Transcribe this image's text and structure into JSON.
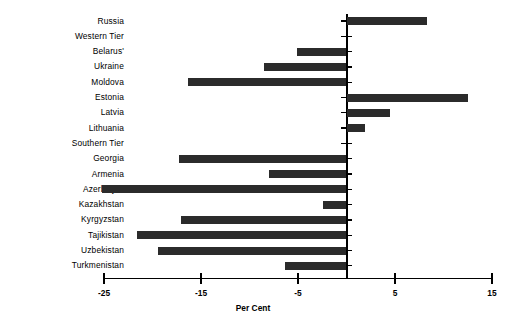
{
  "chart_data": {
    "type": "bar",
    "orientation": "horizontal",
    "title": "",
    "subtitle": "",
    "xlabel": "Per Cent",
    "ylabel": "",
    "xlim": [
      -25,
      15
    ],
    "xticks": [
      -25,
      -15,
      -5,
      5,
      15
    ],
    "xtick_labels": [
      "-25",
      "-15",
      "-5",
      "5",
      "15"
    ],
    "grid": false,
    "legend": null,
    "bar_color": "#2b2b2b",
    "axis_color": "#000000",
    "zero_line": 0,
    "categories": [
      "Russia",
      "Western Tier",
      "Belarus'",
      "Ukraine",
      "Moldova",
      "Estonia",
      "Latvia",
      "Lithuania",
      "Southern Tier",
      "Georgia",
      "Armenia",
      "Azerbaijan",
      "Kazakhstan",
      "Kyrgyzstan",
      "Tajikistan",
      "Uzbekistan",
      "Turkmenistan"
    ],
    "values": [
      8.3,
      null,
      -5.1,
      -8.5,
      -16.3,
      12.5,
      4.5,
      1.9,
      null,
      -17.3,
      -8.0,
      -25.2,
      -2.4,
      -17.1,
      -21.6,
      -19.4,
      -6.3
    ]
  },
  "axis": {
    "x_title": "Per Cent"
  }
}
